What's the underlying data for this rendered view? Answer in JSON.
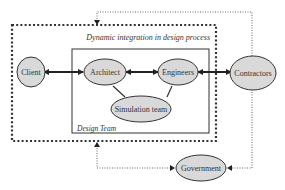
{
  "diagram": {
    "outer_caption": "Dynamic integration in design process",
    "inner_caption": "Design Team",
    "nodes": {
      "client": "Client",
      "architect": "Architect",
      "engineers": "Engineers",
      "simulation": "Simulation team",
      "contractors": "Contractors",
      "government": "Government"
    },
    "colors": {
      "node_fill": "#d9d9d9",
      "node_stroke": "#333333",
      "line": "#222222",
      "dotted": "#555555"
    }
  }
}
